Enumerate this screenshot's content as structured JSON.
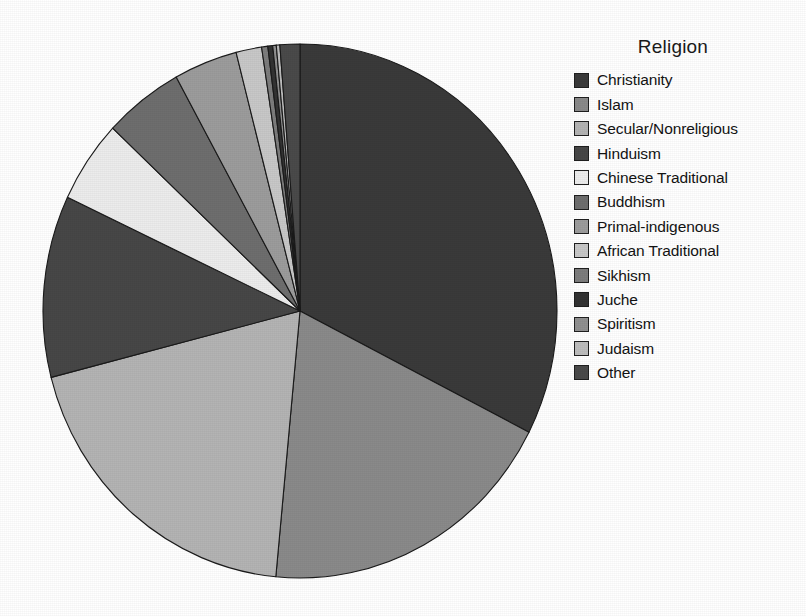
{
  "legend": {
    "title": "Religion",
    "items": [
      {
        "label": "Christianity",
        "color": "#3a3a3a"
      },
      {
        "label": "Islam",
        "color": "#8a8a8a"
      },
      {
        "label": "Secular/Nonreligious",
        "color": "#b4b4b4"
      },
      {
        "label": "Hinduism",
        "color": "#474747"
      },
      {
        "label": "Chinese Traditional",
        "color": "#ececec"
      },
      {
        "label": "Buddhism",
        "color": "#6e6e6e"
      },
      {
        "label": "Primal-indigenous",
        "color": "#9c9c9c"
      },
      {
        "label": "African Traditional",
        "color": "#c8c8c8"
      },
      {
        "label": "Sikhism",
        "color": "#7d7d7d"
      },
      {
        "label": "Juche",
        "color": "#333333"
      },
      {
        "label": "Spiritism",
        "color": "#909090"
      },
      {
        "label": "Judaism",
        "color": "#bdbdbd"
      },
      {
        "label": "Other",
        "color": "#4a4a4a"
      }
    ]
  },
  "chart_data": {
    "type": "pie",
    "title": "Religion",
    "legend_title": "Religion",
    "legend_position": "right",
    "start_angle_deg": 0,
    "direction": "clockwise",
    "units": "percent of world population",
    "categories": [
      "Christianity",
      "Islam",
      "Secular/Nonreligious",
      "Hinduism",
      "Chinese Traditional",
      "Buddhism",
      "Primal-indigenous",
      "African Traditional",
      "Sikhism",
      "Juche",
      "Spiritism",
      "Judaism",
      "Other"
    ],
    "values": [
      32.5,
      19.0,
      19.5,
      11.0,
      5.0,
      5.0,
      4.0,
      1.6,
      0.38,
      0.3,
      0.23,
      0.22,
      1.27
    ],
    "slice_angles_deg": [
      117.0,
      68.4,
      70.2,
      39.6,
      18.0,
      18.0,
      14.4,
      5.8,
      1.4,
      1.1,
      0.8,
      0.8,
      4.5
    ],
    "colors": [
      "#3a3a3a",
      "#8a8a8a",
      "#b4b4b4",
      "#474747",
      "#ececec",
      "#6e6e6e",
      "#9c9c9c",
      "#c8c8c8",
      "#7d7d7d",
      "#333333",
      "#909090",
      "#bdbdbd",
      "#4a4a4a"
    ],
    "geometry": {
      "cx": 274,
      "cy": 275,
      "rx": 257,
      "ry": 267
    },
    "stroke": "#1a1a1a",
    "stroke_width": 1.1,
    "background": "#ffffff",
    "grid": false
  }
}
